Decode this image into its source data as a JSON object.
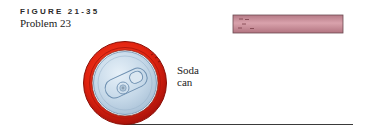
{
  "figure": {
    "number_label": "FIGURE 21-35",
    "caption": "Problem 23"
  },
  "labels": {
    "can_line1": "Soda",
    "can_line2": "can"
  },
  "colors": {
    "can_rim": "#d81e10",
    "can_rim_dark": "#9a1008",
    "can_top": "#c9dbea",
    "can_outline": "#6d8fb0",
    "rod_fill": "#c98a96",
    "rod_outline": "#6b4a52",
    "ground_line": "#333333"
  }
}
